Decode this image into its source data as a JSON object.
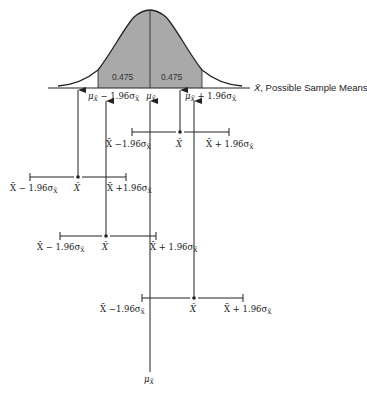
{
  "diagram": {
    "type": "sampling-distribution-confidence-intervals",
    "axis": {
      "label": ", Possible Sample Means",
      "variable": "X̄"
    },
    "curve": {
      "shaded_areas": [
        {
          "label": "0.475",
          "side": "left"
        },
        {
          "label": "0.475",
          "side": "right"
        }
      ]
    },
    "axis_marks": {
      "lower": {
        "mu": "μ",
        "sub": "X̄",
        "rest": " − 1.96σ",
        "rest_sub": "X̄"
      },
      "center": {
        "mu": "μ",
        "sub": "X̄"
      },
      "upper": {
        "mu": "μ",
        "sub": "X̄",
        "rest": " + 1.96σ",
        "rest_sub": "X̄"
      }
    },
    "intervals": [
      {
        "lower_label": "X̄ −1.96σ",
        "lower_sub": "X̄",
        "mean_label": "X̄",
        "upper_label": "X̄ + 1.96σ",
        "upper_sub": "X̄"
      },
      {
        "lower_label": "X̄ − 1.96σ",
        "lower_sub": "X̄",
        "mean_label": "X̄",
        "upper_label": "X̄ +1.96σ",
        "upper_sub": "X̄"
      },
      {
        "lower_label": "X̄ − 1.96σ",
        "lower_sub": "X̄",
        "mean_label": "X̄",
        "upper_label": "X̄ + 1.96σ",
        "upper_sub": "X̄"
      },
      {
        "lower_label": "X̄ −1.96σ",
        "lower_sub": "X̄",
        "mean_label": "X̄",
        "upper_label": "X̄ + 1.96σ",
        "upper_sub": "X̄"
      }
    ],
    "bottom_label": {
      "mu": "μ",
      "sub": "X̄"
    },
    "colors": {
      "shade": "#a9a9a9",
      "line": "#222222"
    }
  }
}
